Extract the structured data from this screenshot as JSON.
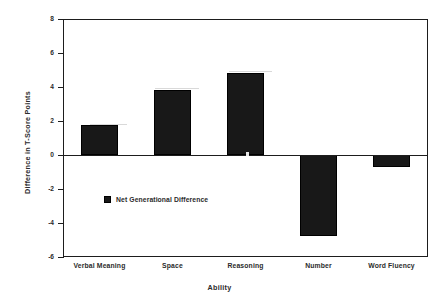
{
  "chart_data": {
    "type": "bar",
    "title": "",
    "subtitle": "",
    "xlabel": "Ability",
    "ylabel": "Difference in T-Score Points",
    "categories": [
      "Verbal Meaning",
      "Space",
      "Reasoning",
      "Number",
      "Word Fluency"
    ],
    "series": [
      {
        "name": "Net Generational Difference",
        "values": [
          1.76,
          3.85,
          4.85,
          -4.75,
          -0.7
        ]
      }
    ],
    "values": [
      1.76,
      3.85,
      4.85,
      -4.75,
      -0.7
    ],
    "ylim": [
      -6,
      8
    ],
    "yticks": [
      8,
      6,
      4,
      2,
      0,
      -2,
      -4,
      -6
    ],
    "ytick_labels": [
      "8",
      "6",
      "4",
      "2",
      "0",
      "-2",
      "-4",
      "-6"
    ],
    "grid": false,
    "legend": {
      "position": "inside-lower-left",
      "entries": [
        {
          "label": "Net Generational Difference",
          "color": "#181818",
          "marker": "square"
        }
      ]
    },
    "axis_color": "#1d1d1d",
    "bar_color": "#181818",
    "background": "#ffffff",
    "zero_line": 0
  }
}
